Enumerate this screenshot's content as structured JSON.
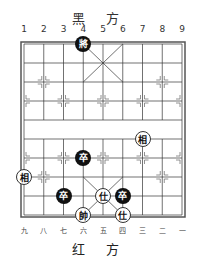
{
  "board": {
    "top_label": "黑 方",
    "bottom_label": "红 方",
    "top_numbers": [
      "1",
      "2",
      "3",
      "4",
      "5",
      "6",
      "7",
      "8",
      "9"
    ],
    "bottom_numbers": [
      "九",
      "八",
      "七",
      "六",
      "五",
      "四",
      "三",
      "二",
      "一"
    ]
  },
  "pieces": [
    {
      "char": "將",
      "side": "black",
      "col": 4,
      "row": 0
    },
    {
      "char": "相",
      "side": "red",
      "col": 7,
      "row": 5
    },
    {
      "char": "卒",
      "side": "black",
      "col": 4,
      "row": 6
    },
    {
      "char": "相",
      "side": "red",
      "col": 1,
      "row": 7
    },
    {
      "char": "卒",
      "side": "black",
      "col": 3,
      "row": 8
    },
    {
      "char": "仕",
      "side": "red",
      "col": 5,
      "row": 8
    },
    {
      "char": "卒",
      "side": "black",
      "col": 6,
      "row": 8
    },
    {
      "char": "帥",
      "side": "red",
      "col": 4,
      "row": 9
    },
    {
      "char": "仕",
      "side": "red",
      "col": 6,
      "row": 9
    }
  ]
}
